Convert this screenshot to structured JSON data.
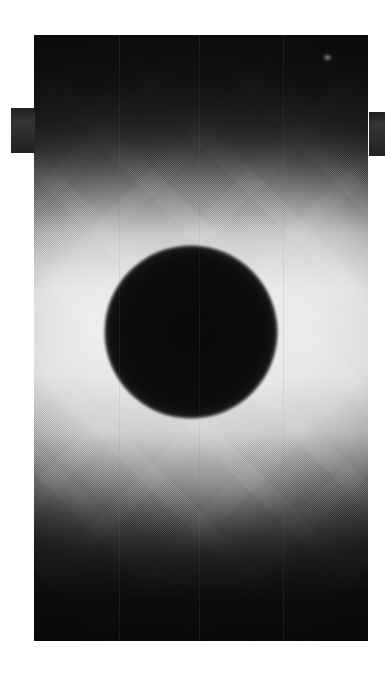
{
  "image": {
    "kind": "halftone-printed grayscale photograph",
    "subject": "backlit field with central opaque circular disc",
    "orientation": "portrait",
    "canvas_width": 385,
    "canvas_height": 682,
    "background_color": "#ffffff"
  },
  "plate": {
    "label": "photographic plate",
    "left": 34,
    "top": 35,
    "width": 334,
    "height": 606,
    "dark_edge_color": "#0c0c0c",
    "bright_field_color": "#ececeb",
    "description": "rectangular printed frame, dark at top and bottom, bright luminous band across the middle"
  },
  "disc": {
    "label": "central dark disc",
    "center_x": 191,
    "center_y": 332,
    "radius": 87,
    "fill_color": "#080808",
    "description": "solid black circular body silhouetted against the bright field"
  },
  "speck": {
    "label": "bright speck",
    "center_x": 328,
    "center_y": 58,
    "color": "#d7d7d5"
  },
  "tabs": [
    {
      "name": "left-mount-tab",
      "left": 11,
      "top": 108,
      "width": 24,
      "height": 45,
      "color": "#2e2e2e"
    },
    {
      "name": "right-mount-tab",
      "left": 369,
      "top": 112,
      "width": 16,
      "height": 44,
      "color": "#2e2e2e"
    }
  ],
  "seams": {
    "label": "faint vertical print seams",
    "color": "#787878",
    "positions_percent": [
      25.5,
      49.5,
      74.5
    ]
  }
}
